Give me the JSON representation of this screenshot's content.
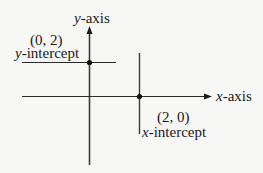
{
  "diagram": {
    "axes": {
      "x_label_var": "x",
      "x_label_rest": "-axis",
      "y_label_var": "y",
      "y_label_rest": "-axis"
    },
    "points": [
      {
        "coord_label": "(0, 2)",
        "name_var": "y",
        "name_rest": "-intercept"
      },
      {
        "coord_label": "(2, 0)",
        "name_var": "x",
        "name_rest": "-intercept"
      }
    ],
    "colors": {
      "line": "#333333",
      "background": "#f7f7f6",
      "text": "#1a1a1a"
    }
  }
}
